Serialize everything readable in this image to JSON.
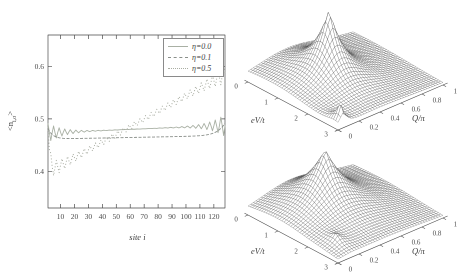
{
  "figure": {
    "width": 459,
    "height": 279,
    "background": "#ffffff",
    "ink": "#4a4a4a"
  },
  "chart_data": [
    {
      "id": "density-profile",
      "type": "line",
      "title": "",
      "xlabel": "site i",
      "ylabel": "<n_i,σ>",
      "ylabel_parts": {
        "open": "<n",
        "sub": "i,σ",
        "close": ">"
      },
      "n_sites": 128,
      "xlim": [
        1,
        128
      ],
      "ylim": [
        0.33,
        0.66
      ],
      "xticks": [
        10,
        20,
        30,
        40,
        50,
        60,
        70,
        80,
        90,
        100,
        110,
        120
      ],
      "yticks": [
        0.4,
        0.5,
        0.6
      ],
      "grid": false,
      "legend": {
        "position": "top-right",
        "entries": [
          {
            "label": "η=0.0",
            "style": "solid",
            "color": "#a9b0a4"
          },
          {
            "label": "η=0.1",
            "style": "dashed",
            "color": "#8a8f8a"
          },
          {
            "label": "η=0.5",
            "style": "dotted",
            "color": "#a9ada2"
          }
        ]
      },
      "series": [
        {
          "name": "η=0.0",
          "color": "#a9b0a4",
          "dash": [],
          "lw": 0.9,
          "model": {
            "kind": "friedel",
            "base": 0.4735,
            "slope": 0.014,
            "ampL": 0.018,
            "ampR": 0.021,
            "decay": 11,
            "period": 4
          },
          "summary": "Friedel-like oscillations ~0.49 at left edge decaying to flat ~0.474, growing again to ~0.50 at right edge"
        },
        {
          "name": "η=0.1",
          "color": "#8a8f8a",
          "dash": [
            3,
            1.5
          ],
          "lw": 0.9,
          "model": {
            "kind": "smooth",
            "base": 0.4615,
            "slope": 0.0065,
            "leftAmp": 0.02,
            "leftDecay": 3.5,
            "rightAmp": 0.024,
            "rightDecay": 5.5
          },
          "summary": "smooth profile ~0.462-0.468 across chain, rising to ~0.49 at right edge"
        },
        {
          "name": "η=0.5",
          "color": "#a9ada2",
          "dash": [
            1,
            2.2
          ],
          "lw": 1,
          "model": {
            "kind": "ramp",
            "start": 0.398,
            "end": 0.585,
            "spikeAmp": 0.105,
            "spikeDecay": 1.1,
            "oscBase": 0.005,
            "edgeAmp": 0.013,
            "edgeDecay": 14,
            "period": 4
          },
          "summary": "nearly linear ramp from ~0.40 at site 1 to ~0.585 at site 128 with edge oscillations"
        }
      ]
    },
    {
      "id": "surface-top",
      "type": "surface",
      "xlabel": "eV/t",
      "ylabel": "Q/π",
      "xlim": [
        0,
        3
      ],
      "ylim": [
        0,
        1
      ],
      "xticks": [
        0,
        1,
        2,
        3
      ],
      "yticks": [
        0,
        0.2,
        0.4,
        0.6,
        0.8,
        1
      ],
      "grid_size": [
        40,
        40
      ],
      "zmodel": {
        "floor": 0.03,
        "cones": [
          {
            "v": 1.3,
            "q": 0.4,
            "amp": 0.95,
            "wv": 0.85,
            "wq": 0.24,
            "sharp": 2.0
          },
          {
            "v": 2.9,
            "q": 0.05,
            "amp": 0.3,
            "wv": 0.45,
            "wq": 0.08,
            "sharp": 2.4
          }
        ],
        "gauss": [
          {
            "v": 0.5,
            "q": 0.35,
            "amp": 0.2,
            "wv": 1.8,
            "wq": 0.55
          }
        ]
      },
      "summary": "wireframe surface, tall sharp peak near eV/t≈1.3 and Q/π≈0.4 with steep crater-like front face, small spike at the eV/t=3, Q/π=0 corner"
    },
    {
      "id": "surface-bottom",
      "type": "surface",
      "xlabel": "eV/t",
      "ylabel": "Q/π",
      "xlim": [
        0,
        3
      ],
      "ylim": [
        0,
        1
      ],
      "xticks": [
        0,
        1,
        2,
        3
      ],
      "yticks": [
        0,
        0.2,
        0.4,
        0.6,
        0.8,
        1
      ],
      "grid_size": [
        40,
        40
      ],
      "zmodel": {
        "floor": 0.02,
        "cones": [
          {
            "v": 1.1,
            "q": 0.42,
            "amp": 0.92,
            "wv": 1.05,
            "wq": 0.33,
            "sharp": 1.7
          },
          {
            "v": 2.5,
            "q": 0.13,
            "amp": 0.15,
            "wv": 0.5,
            "wq": 0.11,
            "sharp": 2.2
          }
        ],
        "gauss": [
          {
            "v": 0.6,
            "q": 0.4,
            "amp": 0.12,
            "wv": 2.0,
            "wq": 0.6
          }
        ]
      },
      "summary": "smoother wireframe surface with broad peak near eV/t≈1.1, Q/π≈0.42 and small bump near eV/t≈2.5, Q/π≈0.13"
    }
  ]
}
